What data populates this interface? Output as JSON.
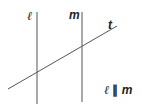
{
  "diagram": {
    "lines": [
      {
        "name": "l",
        "x1": 37,
        "y1": 12,
        "x2": 37,
        "y2": 104
      },
      {
        "name": "m",
        "x1": 82,
        "y1": 12,
        "x2": 82,
        "y2": 102
      },
      {
        "name": "t",
        "x1": 8,
        "y1": 89,
        "x2": 117,
        "y2": 26
      }
    ],
    "stroke_color": "#555555",
    "labels": {
      "line_l": "ℓ",
      "line_m": "m",
      "line_t": "t"
    },
    "relation": {
      "left": "ℓ",
      "symbol": "∥",
      "right": "m"
    }
  }
}
